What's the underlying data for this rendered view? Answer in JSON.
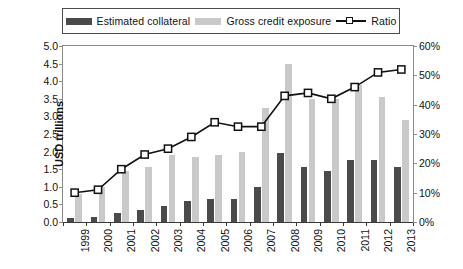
{
  "legend": {
    "items": [
      {
        "label": "Estimated collateral",
        "marker": "swatch-dark",
        "color": "#4a4a4a"
      },
      {
        "label": "Gross credit exposure",
        "marker": "swatch-light",
        "color": "#c9c9c9"
      },
      {
        "label": "Ratio",
        "marker": "line-square",
        "color": "#111111"
      }
    ]
  },
  "chart_data": {
    "type": "bar",
    "title": "",
    "subtitle": "",
    "xlabel": "",
    "ylabel": "USD trillions",
    "y2label": "",
    "grid": false,
    "legend_position": "top",
    "categories": [
      "1999",
      "2000",
      "2001",
      "2002",
      "2003",
      "2004",
      "2005",
      "2006",
      "2007",
      "2008",
      "2009",
      "2010",
      "2011",
      "2012",
      "2013"
    ],
    "ylim": [
      0,
      5
    ],
    "yticks": [
      "0.0",
      "0.5",
      "1.0",
      "1.5",
      "2.0",
      "2.5",
      "3.0",
      "3.5",
      "4.0",
      "4.5",
      "5.0"
    ],
    "ytick_values": [
      0,
      0.5,
      1,
      1.5,
      2,
      2.5,
      3,
      3.5,
      4,
      4.5,
      5
    ],
    "y2lim": [
      0,
      60
    ],
    "y2ticks": [
      "0%",
      "10%",
      "20%",
      "30%",
      "40%",
      "50%",
      "60%"
    ],
    "y2tick_values": [
      0,
      10,
      20,
      30,
      40,
      50,
      60
    ],
    "series": [
      {
        "name": "Estimated collateral",
        "type": "bar",
        "axis": "left",
        "unit": "USD trillions",
        "color": "#4a4a4a",
        "values": [
          0.1,
          0.15,
          0.25,
          0.35,
          0.45,
          0.6,
          0.65,
          0.65,
          1.0,
          1.95,
          1.55,
          1.45,
          1.75,
          1.75,
          1.55
        ]
      },
      {
        "name": "Gross credit exposure",
        "type": "bar",
        "axis": "left",
        "unit": "USD trillions",
        "color": "#c9c9c9",
        "values": [
          0.8,
          1.0,
          1.45,
          1.55,
          1.9,
          1.85,
          1.9,
          2.0,
          3.25,
          4.5,
          3.5,
          3.5,
          3.9,
          3.55,
          2.9
        ]
      },
      {
        "name": "Ratio",
        "type": "line",
        "axis": "right",
        "unit": "%",
        "color": "#111111",
        "marker": "square-open",
        "values": [
          10,
          11,
          18,
          23,
          25,
          29,
          34,
          32.5,
          32.5,
          43,
          44,
          42,
          46,
          51,
          52
        ]
      }
    ]
  }
}
